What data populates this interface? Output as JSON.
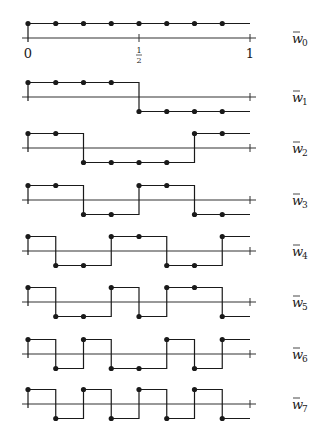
{
  "figure": {
    "line_color": "#1a1a1a",
    "axis_color": "#333333",
    "x_axis": {
      "ticks": [
        {
          "value": 0,
          "label": "0"
        },
        {
          "value": 0.5,
          "label_num": "1",
          "label_den": "2"
        },
        {
          "value": 1,
          "label": "1"
        }
      ]
    },
    "rows": [
      {
        "label": "w",
        "subscript": "0",
        "signs": [
          1,
          1,
          1,
          1,
          1,
          1,
          1,
          1
        ]
      },
      {
        "label": "w",
        "subscript": "1",
        "signs": [
          1,
          1,
          1,
          1,
          -1,
          -1,
          -1,
          -1
        ]
      },
      {
        "label": "w",
        "subscript": "2",
        "signs": [
          1,
          1,
          -1,
          -1,
          -1,
          -1,
          1,
          1
        ]
      },
      {
        "label": "w",
        "subscript": "3",
        "signs": [
          1,
          1,
          -1,
          -1,
          1,
          1,
          -1,
          -1
        ]
      },
      {
        "label": "w",
        "subscript": "4",
        "signs": [
          1,
          -1,
          -1,
          1,
          1,
          -1,
          -1,
          1
        ]
      },
      {
        "label": "w",
        "subscript": "5",
        "signs": [
          1,
          -1,
          -1,
          1,
          -1,
          1,
          1,
          -1
        ]
      },
      {
        "label": "w",
        "subscript": "6",
        "signs": [
          1,
          -1,
          1,
          -1,
          -1,
          1,
          -1,
          1
        ]
      },
      {
        "label": "w",
        "subscript": "7",
        "signs": [
          1,
          -1,
          1,
          -1,
          1,
          -1,
          1,
          -1
        ]
      }
    ]
  },
  "chart_data": {
    "type": "line",
    "title": "",
    "xlabel": "",
    "ylabel": "",
    "xlim": [
      0,
      1
    ],
    "x_tick_labels": [
      "0",
      "1/2",
      "1"
    ],
    "sample_points": [
      0,
      0.125,
      0.25,
      0.375,
      0.5,
      0.625,
      0.75,
      0.875
    ],
    "series": [
      {
        "name": "w̃0",
        "values": [
          1,
          1,
          1,
          1,
          1,
          1,
          1,
          1
        ]
      },
      {
        "name": "w̃1",
        "values": [
          1,
          1,
          1,
          1,
          -1,
          -1,
          -1,
          -1
        ]
      },
      {
        "name": "w̃2",
        "values": [
          1,
          1,
          -1,
          -1,
          -1,
          -1,
          1,
          1
        ]
      },
      {
        "name": "w̃3",
        "values": [
          1,
          1,
          -1,
          -1,
          1,
          1,
          -1,
          -1
        ]
      },
      {
        "name": "w̃4",
        "values": [
          1,
          -1,
          -1,
          1,
          1,
          -1,
          -1,
          1
        ]
      },
      {
        "name": "w̃5",
        "values": [
          1,
          -1,
          -1,
          1,
          -1,
          1,
          1,
          -1
        ]
      },
      {
        "name": "w̃6",
        "values": [
          1,
          -1,
          1,
          -1,
          -1,
          1,
          -1,
          1
        ]
      },
      {
        "name": "w̃7",
        "values": [
          1,
          -1,
          1,
          -1,
          1,
          -1,
          1,
          -1
        ]
      }
    ],
    "grid": false,
    "legend": "right-side row labels"
  }
}
